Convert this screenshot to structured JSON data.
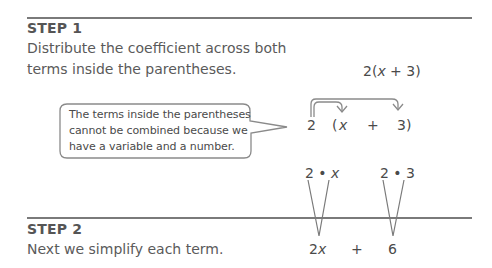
{
  "step1": {
    "label": "STEP 1",
    "text_line1": "Distribute the coefficient across both",
    "text_line2": "terms inside the parentheses.",
    "expression": {
      "coef": "2(",
      "var": "x",
      "rest": " + 3)"
    }
  },
  "callout": {
    "line1": "The terms inside the parentheses",
    "line2": "cannot be combined because we",
    "line3": "have a variable and a number."
  },
  "distribution": {
    "coef": "2",
    "open": "(",
    "var": "x",
    "plus": "+",
    "const": "3)"
  },
  "products": {
    "first_coef": "2 • ",
    "first_var": "x",
    "second": "2 • 3"
  },
  "step2": {
    "label": "STEP 2",
    "text": "Next we simplify each term."
  },
  "result": {
    "first_coef": "2",
    "first_var": "x",
    "plus": "+",
    "second": "6"
  },
  "colors": {
    "text": "#555555",
    "rule": "#7a7a7a",
    "arrow": "#8a8a8a"
  }
}
